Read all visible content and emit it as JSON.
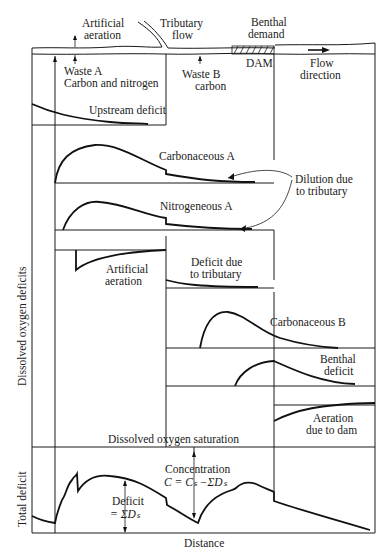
{
  "river": {
    "artificial_aeration": [
      "Artificial",
      "aeration"
    ],
    "tributary_flow": [
      "Tributary",
      "flow"
    ],
    "benthal_demand": [
      "Benthal",
      "demand"
    ],
    "dam": "DAM",
    "flow_direction": [
      "Flow",
      "direction"
    ],
    "waste_a": [
      "Waste A",
      "Carbon and nitrogen"
    ],
    "waste_b": [
      "Waste B",
      "carbon"
    ]
  },
  "panels": {
    "upstream_deficit": "Upstream deficit",
    "carbonaceous_a": "Carbonaceous A",
    "dilution": [
      "Dilution due",
      "to tributary"
    ],
    "nitrogeneous_a": "Nitrogeneous A",
    "artificial_aeration": [
      "Artificial",
      "aeration"
    ],
    "deficit_tributary": [
      "Deficit due",
      "to tributary"
    ],
    "carbonaceous_b": "Carbonaceous B",
    "benthal_deficit": [
      "Benthal",
      "deficit"
    ],
    "aeration_dam": [
      "Aeration",
      "due to dam"
    ],
    "do_saturation": "Dissolved oxygen saturation"
  },
  "total": {
    "concentration": "Concentration",
    "concentration_formula": "C = Cₛ −ΣDₛ",
    "deficit": "Deficit",
    "deficit_formula": "= ΣDₛ"
  },
  "axes": {
    "y_upper": "Dissolved oxygen deficits",
    "y_lower": "Total deficit",
    "x": "Distance"
  }
}
